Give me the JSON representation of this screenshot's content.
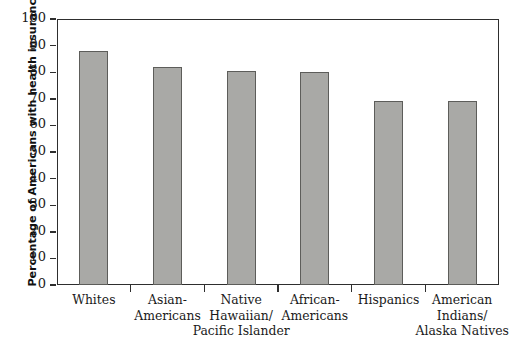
{
  "chart_data": {
    "type": "bar",
    "title": "",
    "xlabel": "",
    "ylabel": "Percentage of Americans with health insurance",
    "ylim": [
      0,
      100
    ],
    "yticks": [
      "0",
      "10",
      "20",
      "30",
      "40",
      "50",
      "60",
      "70",
      "80",
      "90",
      "100"
    ],
    "grid": false,
    "legend": "none",
    "categories": [
      "Whites",
      "Asian-Americans",
      "Native Hawaiian/ Pacific Islander",
      "African-Americans",
      "Hispanics",
      "American Indians/ Alaska Natives"
    ],
    "category_lines": [
      [
        "Whites"
      ],
      [
        "Asian-",
        "Americans"
      ],
      [
        "Native",
        "Hawaiian/",
        "Pacific Islander"
      ],
      [
        "African-",
        "Americans"
      ],
      [
        "Hispanics"
      ],
      [
        "American",
        "Indians/",
        "Alaska Natives"
      ]
    ],
    "values": [
      88,
      82,
      80.5,
      80,
      69,
      69
    ],
    "bar_color": "#a9a9a6",
    "bar_border_color": "#5d5d5a",
    "axis_color": "#2e2e2e"
  },
  "artifacts": {
    "top": "",
    "bottom": ""
  }
}
